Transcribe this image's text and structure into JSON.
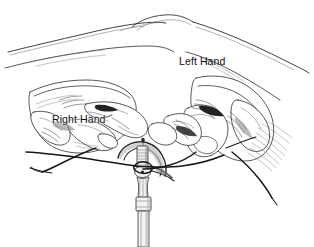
{
  "figure": {
    "medium": "pen-and-ink line drawing",
    "background_color": "#ffffff",
    "ink_color": "#2b2b2b",
    "width": 314,
    "height": 247,
    "labels": {
      "left_hand": "Left Hand",
      "right_hand": "Right Hand"
    },
    "subjects": [
      {
        "name": "left-hand",
        "label": "Left Hand"
      },
      {
        "name": "right-hand",
        "label": "Right Hand"
      },
      {
        "name": "suture-thread",
        "label": ""
      },
      {
        "name": "surgical-instrument",
        "label": ""
      }
    ]
  }
}
